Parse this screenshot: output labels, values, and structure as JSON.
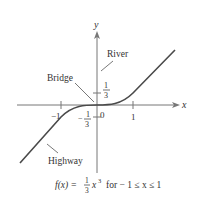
{
  "diagram": {
    "axis_x_label": "x",
    "axis_y_label": "y",
    "tick_x_neg1": "−1",
    "tick_x_0": "0",
    "tick_x_1": "1",
    "tick_y_pos_num": "1",
    "tick_y_pos_den": "3",
    "tick_y_neg_sign": "−",
    "tick_y_neg_num": "1",
    "tick_y_neg_den": "3",
    "label_river": "River",
    "label_bridge": "Bridge",
    "label_highway": "Highway",
    "caption_lhs": "f(x) = ",
    "caption_frac_num": "1",
    "caption_frac_den": "3",
    "caption_x": "x",
    "caption_exp": "3",
    "caption_rhs": "for − 1 ≤ x ≤ 1",
    "colors": {
      "curve": "#4a4a4a",
      "axis": "#777777",
      "text": "#333333"
    }
  }
}
